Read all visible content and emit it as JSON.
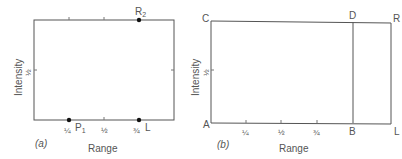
{
  "panels": [
    {
      "id": "a",
      "caption": "(a)",
      "xlabel": "Range",
      "ylabel": "Intensity",
      "y_tick": "½",
      "x_ticks": [
        "¼",
        "½",
        "¾"
      ],
      "points": [
        {
          "label": "P₁",
          "position": "bottom at ¼"
        },
        {
          "label": "L",
          "position": "bottom at ¾"
        },
        {
          "label": "R₂",
          "position": "top at ¾"
        }
      ]
    },
    {
      "id": "b",
      "caption": "(b)",
      "xlabel": "Range",
      "ylabel": "Intensity",
      "y_tick": "½",
      "x_ticks": [
        "¼",
        "½",
        "¾"
      ],
      "corners": {
        "bottom_left": "A",
        "top_left": "C",
        "top_mid": "D",
        "bottom_mid": "B",
        "top_right": "R",
        "bottom_right": "L"
      }
    }
  ],
  "colors": {
    "line": "#555555",
    "point": "#111111",
    "text": "#555555"
  }
}
